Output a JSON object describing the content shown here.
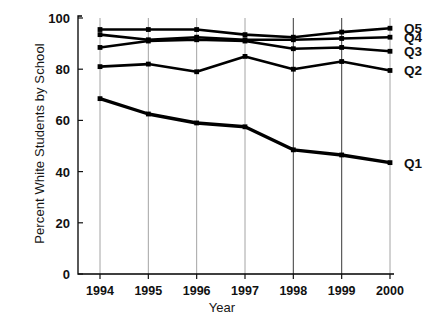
{
  "chart_data": {
    "type": "line",
    "title": "",
    "xlabel": "Year",
    "ylabel": "Percent White Students by School",
    "x": [
      1994,
      1995,
      1996,
      1997,
      1998,
      1999,
      2000
    ],
    "categories": [
      "1994",
      "1995",
      "1996",
      "1997",
      "1998",
      "1999",
      "2000"
    ],
    "xtick_labels": [
      "1994",
      "1995",
      "1996",
      "1997",
      "1998",
      "1999",
      "2000"
    ],
    "ytick_labels": [
      "100",
      "80",
      "60",
      "40",
      "20",
      "0"
    ],
    "ytick_values": [
      100,
      80,
      60,
      40,
      20,
      0
    ],
    "ylim": [
      0,
      100
    ],
    "xlim": [
      1994,
      2000
    ],
    "grid": "vertical",
    "legend_position": "right-of-axes-inline",
    "line_color": "#000000",
    "grid_color": "#9a9a9a",
    "axis_color": "#000000",
    "series": [
      {
        "name": "Q5",
        "label": "Q5",
        "values": [
          95.5,
          95.5,
          95.5,
          93.5,
          92.5,
          94.5,
          96.0
        ]
      },
      {
        "name": "Q4",
        "label": "Q4",
        "values": [
          93.5,
          91.5,
          92.5,
          91.5,
          91.5,
          92.0,
          92.5
        ]
      },
      {
        "name": "Q3",
        "label": "Q3",
        "values": [
          88.5,
          91.0,
          91.5,
          91.0,
          88.0,
          88.5,
          87.0
        ]
      },
      {
        "name": "Q2",
        "label": "Q2",
        "values": [
          81.0,
          82.0,
          79.0,
          85.0,
          80.0,
          83.0,
          79.5
        ]
      },
      {
        "name": "Q1",
        "label": "Q1",
        "values": [
          68.5,
          62.5,
          59.0,
          57.5,
          48.5,
          46.5,
          43.5
        ]
      }
    ]
  }
}
